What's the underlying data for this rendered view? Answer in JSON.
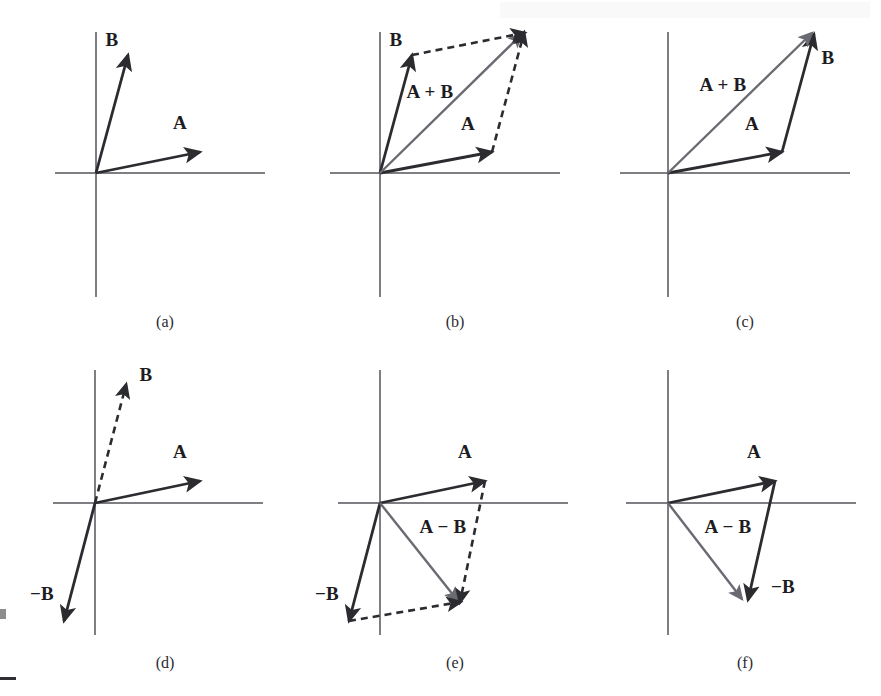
{
  "figure": {
    "width": 881,
    "height": 696,
    "background_color": "#ffffff",
    "stroke_color": "#2b2b30",
    "resultant_color": "#55555c",
    "axis_color": "#55555a"
  },
  "chart_data": {
    "type": "diagram",
    "panels": [
      {
        "id": "a",
        "caption": "(a)",
        "caption_pos": [
          165,
          322
        ],
        "origin": [
          96,
          173
        ],
        "axis_x": [
          55,
          265
        ],
        "axis_y": [
          32,
          297
        ],
        "vectors": [
          {
            "name": "A",
            "label": "A",
            "from": [
              96,
              173
            ],
            "to": [
              200,
              152
            ],
            "style": "solid",
            "color": "#2b2b30",
            "label_pos": [
              180,
              123
            ]
          },
          {
            "name": "B",
            "label": "B",
            "from": [
              96,
              173
            ],
            "to": [
              128,
              55
            ],
            "style": "solid",
            "color": "#2b2b30",
            "label_pos": [
              112,
              40
            ]
          }
        ]
      },
      {
        "id": "b",
        "caption": "(b)",
        "caption_pos": [
          455,
          322
        ],
        "origin": [
          380,
          173
        ],
        "axis_x": [
          330,
          560
        ],
        "axis_y": [
          32,
          297
        ],
        "vectors": [
          {
            "name": "A",
            "label": "A",
            "from": [
              380,
              173
            ],
            "to": [
              492,
              152
            ],
            "style": "solid",
            "color": "#2b2b30",
            "label_pos": [
              468,
              124
            ]
          },
          {
            "name": "B",
            "label": "B",
            "from": [
              380,
              173
            ],
            "to": [
              412,
              55
            ],
            "style": "solid",
            "color": "#2b2b30",
            "label_pos": [
              396,
              40
            ]
          },
          {
            "name": "A+B",
            "label": "A + B",
            "from": [
              380,
              173
            ],
            "to": [
              522,
              34
            ],
            "style": "solid",
            "color": "#6a6a72",
            "label_pos": [
              430,
              92
            ]
          },
          {
            "name": "B-translated",
            "label": "",
            "from": [
              412,
              55
            ],
            "to": [
              524,
              33
            ],
            "style": "dashed",
            "color": "#2b2b30",
            "label_pos": null
          },
          {
            "name": "A-translated",
            "label": "",
            "from": [
              492,
              152
            ],
            "to": [
              524,
              33
            ],
            "style": "dashed",
            "color": "#2b2b30",
            "label_pos": null
          }
        ]
      },
      {
        "id": "c",
        "caption": "(c)",
        "caption_pos": [
          745,
          322
        ],
        "origin": [
          668,
          173
        ],
        "axis_x": [
          620,
          850
        ],
        "axis_y": [
          32,
          297
        ],
        "vectors": [
          {
            "name": "A",
            "label": "A",
            "from": [
              668,
              173
            ],
            "to": [
              782,
              152
            ],
            "style": "solid",
            "color": "#2b2b30",
            "label_pos": [
              752,
              124
            ]
          },
          {
            "name": "B-translated",
            "label": "B",
            "from": [
              782,
              152
            ],
            "to": [
              814,
              34
            ],
            "style": "solid",
            "color": "#2b2b30",
            "label_pos": [
              828,
              58
            ]
          },
          {
            "name": "A+B",
            "label": "A + B",
            "from": [
              668,
              173
            ],
            "to": [
              812,
              33
            ],
            "style": "solid",
            "color": "#6a6a72",
            "label_pos": [
              723,
              85
            ]
          }
        ]
      },
      {
        "id": "d",
        "caption": "(d)",
        "caption_pos": [
          165,
          663
        ],
        "origin": [
          95,
          503
        ],
        "axis_x": [
          53,
          263
        ],
        "axis_y": [
          370,
          635
        ],
        "vectors": [
          {
            "name": "A",
            "label": "A",
            "from": [
              95,
              503
            ],
            "to": [
              200,
              481
            ],
            "style": "solid",
            "color": "#2b2b30",
            "label_pos": [
              180,
              452
            ]
          },
          {
            "name": "B",
            "label": "B",
            "from": [
              95,
              503
            ],
            "to": [
              126,
              385
            ],
            "style": "dashed",
            "color": "#2b2b30",
            "label_pos": [
              146,
              375
            ]
          },
          {
            "name": "-B",
            "label": "−B",
            "from": [
              95,
              503
            ],
            "to": [
              64,
              621
            ],
            "style": "solid",
            "color": "#2b2b30",
            "label_pos": [
              42,
              594
            ]
          }
        ]
      },
      {
        "id": "e",
        "caption": "(e)",
        "caption_pos": [
          455,
          663
        ],
        "origin": [
          380,
          503
        ],
        "axis_x": [
          338,
          568
        ],
        "axis_y": [
          370,
          635
        ],
        "vectors": [
          {
            "name": "A",
            "label": "A",
            "from": [
              380,
              503
            ],
            "to": [
              485,
              481
            ],
            "style": "solid",
            "color": "#2b2b30",
            "label_pos": [
              465,
              452
            ]
          },
          {
            "name": "-B",
            "label": "−B",
            "from": [
              380,
              503
            ],
            "to": [
              349,
              621
            ],
            "style": "solid",
            "color": "#2b2b30",
            "label_pos": [
              327,
              594
            ]
          },
          {
            "name": "A-B",
            "label": "A − B",
            "from": [
              380,
              503
            ],
            "to": [
              458,
              601
            ],
            "style": "solid",
            "color": "#6a6a72",
            "label_pos": [
              443,
              527
            ]
          },
          {
            "name": "A-translated",
            "label": "",
            "from": [
              349,
              621
            ],
            "to": [
              460,
              602
            ],
            "style": "dashed",
            "color": "#2b2b30",
            "label_pos": null
          },
          {
            "name": "-B-translated",
            "label": "",
            "from": [
              485,
              481
            ],
            "to": [
              460,
              602
            ],
            "style": "dashed",
            "color": "#2b2b30",
            "label_pos": null
          }
        ]
      },
      {
        "id": "f",
        "caption": "(f)",
        "caption_pos": [
          745,
          663
        ],
        "origin": [
          668,
          503
        ],
        "axis_x": [
          626,
          856
        ],
        "axis_y": [
          370,
          635
        ],
        "vectors": [
          {
            "name": "A",
            "label": "A",
            "from": [
              668,
              503
            ],
            "to": [
              775,
              481
            ],
            "style": "solid",
            "color": "#2b2b30",
            "label_pos": [
              754,
              452
            ]
          },
          {
            "name": "-B-translated",
            "label": "−B",
            "from": [
              775,
              481
            ],
            "to": [
              748,
              600
            ],
            "style": "solid",
            "color": "#2b2b30",
            "label_pos": [
              783,
              587
            ]
          },
          {
            "name": "A-B",
            "label": "A − B",
            "from": [
              668,
              503
            ],
            "to": [
              742,
              599
            ],
            "style": "solid",
            "color": "#6a6a72",
            "label_pos": [
              728,
              527
            ]
          }
        ]
      }
    ]
  }
}
